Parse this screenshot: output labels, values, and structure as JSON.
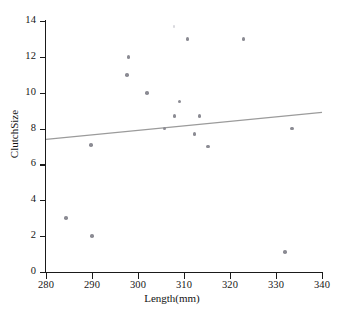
{
  "chart_data": {
    "type": "scatter",
    "title": "",
    "xlabel": "Length(mm)",
    "ylabel": "ClutchSize",
    "xlim": [
      280,
      340
    ],
    "ylim": [
      0,
      14
    ],
    "xticks": [
      280,
      290,
      300,
      310,
      320,
      330,
      340
    ],
    "yticks": [
      0,
      2,
      4,
      6,
      8,
      10,
      12,
      14
    ],
    "grid": false,
    "legend": null,
    "series": [
      {
        "name": "observations",
        "marker": "filled-circle",
        "color": "#8b8b93",
        "points": [
          {
            "x": 284.3,
            "y": 3.0
          },
          {
            "x": 289.8,
            "y": 7.1
          },
          {
            "x": 290.0,
            "y": 2.0
          },
          {
            "x": 297.9,
            "y": 12.0
          },
          {
            "x": 297.6,
            "y": 11.0
          },
          {
            "x": 301.9,
            "y": 10.0
          },
          {
            "x": 305.8,
            "y": 8.0
          },
          {
            "x": 307.9,
            "y": 8.7
          },
          {
            "x": 309.0,
            "y": 9.5
          },
          {
            "x": 310.8,
            "y": 13.0
          },
          {
            "x": 312.3,
            "y": 7.7
          },
          {
            "x": 313.4,
            "y": 8.7
          },
          {
            "x": 315.2,
            "y": 7.0
          },
          {
            "x": 322.9,
            "y": 13.0
          },
          {
            "x": 333.5,
            "y": 8.0
          },
          {
            "x": 331.9,
            "y": 1.1
          }
        ]
      },
      {
        "name": "faint-observation",
        "marker": "faint-circle",
        "color": "#d9d9de",
        "points": [
          {
            "x": 307.8,
            "y": 13.7
          }
        ]
      }
    ],
    "fit_line": {
      "name": "regression-line",
      "color": "#9b9b9b",
      "x_start": 280,
      "y_start": 7.4,
      "x_end": 340,
      "y_end": 8.9
    }
  },
  "axes": {
    "x_tick_labels": [
      "280",
      "290",
      "300",
      "310",
      "320",
      "330",
      "340"
    ],
    "y_tick_labels": [
      "0",
      "2",
      "4",
      "6",
      "8",
      "10",
      "12",
      "14"
    ],
    "x_title": "Length(mm)",
    "y_title": "ClutchSize"
  }
}
